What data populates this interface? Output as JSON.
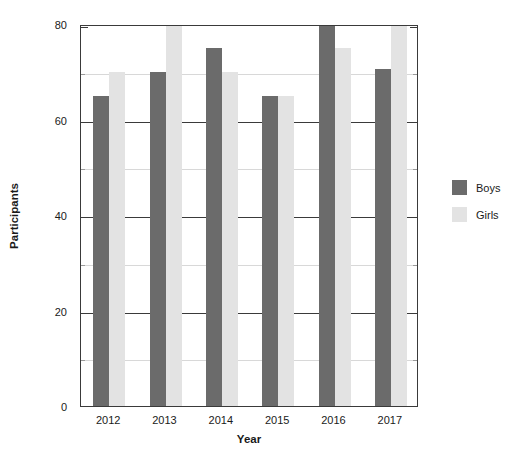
{
  "chart_data": {
    "type": "bar",
    "title": "",
    "xlabel": "Year",
    "ylabel": "Participants",
    "categories": [
      "2012",
      "2013",
      "2014",
      "2015",
      "2016",
      "2017"
    ],
    "series": [
      {
        "name": "Boys",
        "color": "#6b6b6b",
        "values": [
          65,
          70,
          75,
          65,
          80,
          70.5
        ]
      },
      {
        "name": "Girls",
        "color": "#e3e3e3",
        "values": [
          70,
          80,
          70,
          65,
          75,
          80
        ]
      }
    ],
    "ylim": [
      0,
      80
    ],
    "ymajor_ticks": [
      0,
      20,
      40,
      60,
      80
    ],
    "yminor_ticks": [
      10,
      30,
      50,
      70
    ],
    "ytick_labels": [
      "0",
      "20",
      "40",
      "60",
      "80"
    ],
    "grid": true,
    "legend_position": "right",
    "axis_color": "#3a3a3a",
    "gridline_color": "#d8d8d8",
    "background": "#ffffff"
  },
  "legend": {
    "items": [
      {
        "label": "Boys",
        "color": "#6b6b6b"
      },
      {
        "label": "Girls",
        "color": "#e3e3e3"
      }
    ]
  }
}
